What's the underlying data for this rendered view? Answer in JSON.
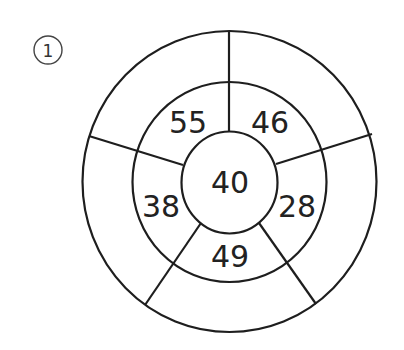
{
  "problem": {
    "index_label": "1",
    "center_value": "40",
    "middle_ring_values": [
      "55",
      "46",
      "28",
      "49",
      "38"
    ],
    "outer_ring_values": [
      "",
      "",
      "",
      "",
      ""
    ]
  },
  "colors": {
    "stroke": "#1e1e1e",
    "text": "#222222",
    "background": "#ffffff"
  }
}
